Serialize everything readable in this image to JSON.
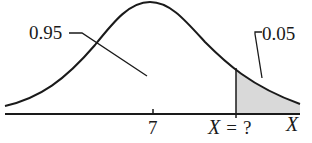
{
  "diagram": {
    "type": "normal-distribution",
    "mean_label": "7",
    "unknown_label": "X = ?",
    "unknown_label_parts": {
      "var": "X",
      "eq": "=",
      "q": "?"
    },
    "axis_label": "X",
    "left_area_label": "0.95",
    "right_tail_label": "0.05",
    "colors": {
      "curve": "#1a1a1a",
      "axis": "#1a1a1a",
      "tail_fill": "#d9d9d9"
    }
  }
}
